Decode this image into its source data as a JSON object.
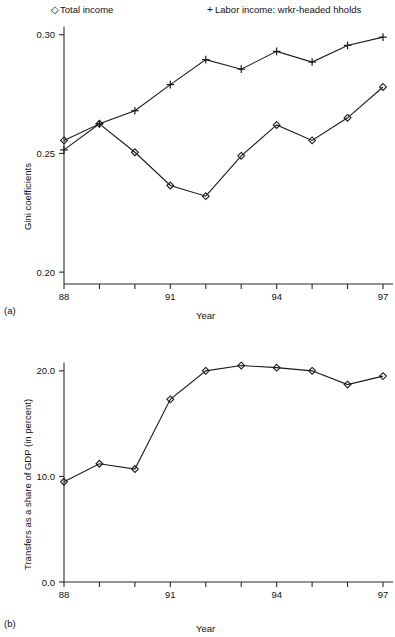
{
  "figure": {
    "panel_a_tag": "(a)",
    "panel_b_tag": "(b)"
  },
  "legend": {
    "entries": [
      {
        "marker": "diamond-marker",
        "glyph": "◇",
        "label": "Total income"
      },
      {
        "marker": "plus-marker",
        "glyph": "+",
        "label": "Labor income: wrkr-headed hholds"
      }
    ]
  },
  "chart_data": [
    {
      "id": "panel-a",
      "type": "line",
      "title": "",
      "xlabel": "Year",
      "ylabel": "Gini coefficients",
      "x": [
        88,
        89,
        90,
        91,
        92,
        93,
        94,
        95,
        96,
        97
      ],
      "xtick_values": [
        88,
        89,
        90,
        91,
        92,
        93,
        94,
        95,
        96,
        97
      ],
      "xtick_labels": [
        "88",
        "",
        "",
        "91",
        "",
        "",
        "94",
        "",
        "",
        "97"
      ],
      "xlim": [
        88,
        97
      ],
      "ylim": [
        0.195,
        0.302
      ],
      "ytick_values": [
        0.2,
        0.25,
        0.3
      ],
      "ytick_labels": [
        "0.20",
        "0.25",
        "0.30"
      ],
      "grid": false,
      "legend_position": "above-plot",
      "series": [
        {
          "name": "Total income",
          "marker": "diamond",
          "values": [
            0.2555,
            0.2625,
            0.2505,
            0.2365,
            0.232,
            0.249,
            0.262,
            0.2555,
            0.265,
            0.278
          ]
        },
        {
          "name": "Labor income: wrkr-headed hholds",
          "marker": "plus",
          "values": [
            0.2515,
            0.2625,
            0.268,
            0.279,
            0.2895,
            0.2855,
            0.293,
            0.2885,
            0.2955,
            0.299
          ]
        }
      ]
    },
    {
      "id": "panel-b",
      "type": "line",
      "title": "",
      "xlabel": "Year",
      "ylabel": "Transfers as a share of GDP (in percent)",
      "x": [
        88,
        89,
        90,
        91,
        92,
        93,
        94,
        95,
        96,
        97
      ],
      "xtick_values": [
        88,
        89,
        90,
        91,
        92,
        93,
        94,
        95,
        96,
        97
      ],
      "xtick_labels": [
        "88",
        "",
        "",
        "91",
        "",
        "",
        "94",
        "",
        "",
        "97"
      ],
      "xlim": [
        88,
        97
      ],
      "ylim": [
        0.0,
        21.5
      ],
      "ytick_values": [
        0.0,
        10.0,
        20.0
      ],
      "ytick_labels": [
        "0.0",
        "10.0",
        "20.0"
      ],
      "grid": false,
      "legend_position": "none",
      "series": [
        {
          "name": "Transfers as a share of GDP",
          "marker": "diamond",
          "values": [
            9.5,
            11.2,
            10.7,
            17.3,
            20.0,
            20.5,
            20.3,
            20.0,
            18.7,
            19.5
          ]
        }
      ]
    }
  ],
  "colors": {
    "ink": "#1a1a1a",
    "axis": "#2b2b2b",
    "background": "#ffffff"
  }
}
